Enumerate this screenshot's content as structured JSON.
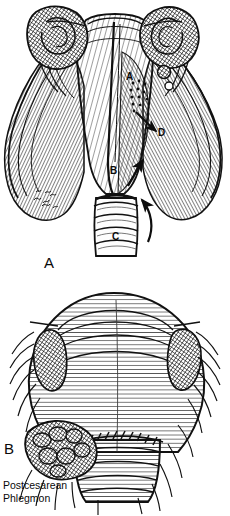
{
  "figure": {
    "kind": "medical-illustration",
    "background_color": "#ffffff",
    "ink_color": "#121212",
    "width": 230,
    "height": 516
  },
  "panels": [
    {
      "id": "A",
      "label": "A",
      "label_x": 45,
      "label_y": 255,
      "subject": "uterus-adnexa-anterior-view-with-infection-spread-routes",
      "keys": [
        {
          "id": "A",
          "label": "A",
          "x": 127,
          "y": 78,
          "meaning": "parametrial-spread"
        },
        {
          "id": "B",
          "label": "B",
          "x": 111,
          "y": 172,
          "meaning": "lower-uterine-segment"
        },
        {
          "id": "C",
          "label": "C",
          "x": 113,
          "y": 238,
          "meaning": "cervix-vagina"
        },
        {
          "id": "D",
          "label": "D",
          "x": 159,
          "y": 134,
          "meaning": "broad-ligament"
        }
      ],
      "arrows": [
        {
          "id": "arrow-a-to-d",
          "from_key": "A",
          "to_key": "D",
          "direction": "down-right"
        },
        {
          "id": "arrow-c-upward",
          "from_key": "C",
          "direction": "up"
        },
        {
          "id": "arrow-b-upward",
          "from_key": "B",
          "direction": "up-right"
        }
      ],
      "stipple_region": {
        "meaning": "infection-spread-stippling",
        "x": 133,
        "y": 86
      },
      "signature": {
        "text": "",
        "x": 36,
        "y": 196,
        "style": "cursive-artist-signature"
      }
    },
    {
      "id": "B",
      "label": "B",
      "label_x": 4,
      "label_y": 440,
      "subject": "enlarged-postcesarean-uterus-with-hysterotomy-suture-line-and-phlegmon",
      "features": [
        {
          "id": "suture-line",
          "meaning": "hysterotomy-incision-stitches"
        },
        {
          "id": "phlegmon-mass",
          "meaning": "parametrial-phlegmon-left"
        },
        {
          "id": "ovary-left",
          "meaning": "left-ovary"
        },
        {
          "id": "ovary-right",
          "meaning": "right-ovary"
        }
      ]
    }
  ],
  "caption": {
    "text": "Postcesarean\nPhlegmon",
    "line1": "Postcesarean",
    "line2": "Phlegmon",
    "x": 3,
    "y": 480
  }
}
